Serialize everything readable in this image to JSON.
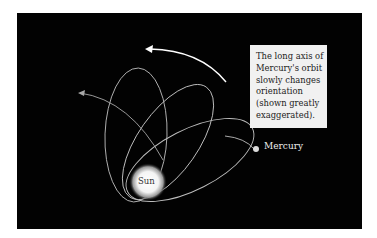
{
  "diagram": {
    "note_lines": [
      "The long axis of",
      "Mercury's orbit",
      "slowly changes",
      "orientation",
      "(shown greatly",
      "exaggerated)."
    ],
    "labels": {
      "sun": "Sun",
      "mercury": "Mercury"
    },
    "colors": {
      "background": "#020202",
      "orbit": "#bdbdbd",
      "arrow": "#ffffff",
      "note_bg": "#f1f1f1"
    }
  }
}
